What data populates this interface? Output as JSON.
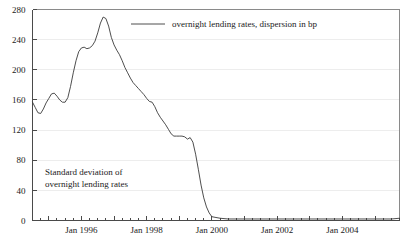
{
  "chart_data": {
    "type": "line",
    "title": "",
    "xlabel": "",
    "ylabel": "",
    "ylim": [
      0,
      280
    ],
    "xlim": [
      "1994-07",
      "2005-10"
    ],
    "grid": true,
    "legend_position": "top-center",
    "legend": [
      "overnight lending rates, dispersion in bp"
    ],
    "annotations": [
      {
        "text_line1": "Standard deviation of",
        "text_line2": "overnight lending rates",
        "x": "1995-04",
        "y": 62
      }
    ],
    "yticks": [
      0,
      40,
      80,
      120,
      160,
      200,
      240,
      280
    ],
    "ytick_labels": [
      "0",
      "40",
      "80",
      "120",
      "160",
      "200",
      "240",
      "280"
    ],
    "xtick_labels": [
      "Jan 1996",
      "Jan 1998",
      "Jan 2000",
      "Jan 2002",
      "Jan 2004"
    ],
    "xtick_positions": [
      "1996-01",
      "1998-01",
      "2000-01",
      "2002-01",
      "2004-01"
    ],
    "minor_tick_interval_months": 3,
    "series": [
      {
        "name": "overnight lending rates, dispersion in bp",
        "color": "#3a3a3a",
        "x": [
          "1994-07",
          "1994-08",
          "1994-09",
          "1994-10",
          "1994-11",
          "1994-12",
          "1995-01",
          "1995-02",
          "1995-03",
          "1995-04",
          "1995-05",
          "1995-06",
          "1995-07",
          "1995-08",
          "1995-09",
          "1995-10",
          "1995-11",
          "1995-12",
          "1996-01",
          "1996-02",
          "1996-03",
          "1996-04",
          "1996-05",
          "1996-06",
          "1996-07",
          "1996-08",
          "1996-09",
          "1996-10",
          "1996-11",
          "1996-12",
          "1997-01",
          "1997-02",
          "1997-03",
          "1997-04",
          "1997-05",
          "1997-06",
          "1997-07",
          "1997-08",
          "1997-09",
          "1997-10",
          "1997-11",
          "1997-12",
          "1998-01",
          "1998-02",
          "1998-03",
          "1998-04",
          "1998-05",
          "1998-06",
          "1998-07",
          "1998-08",
          "1998-09",
          "1998-10",
          "1998-11",
          "1998-12",
          "1999-01",
          "1999-02",
          "1999-03",
          "1999-04",
          "1999-05",
          "1999-06",
          "1999-07",
          "1999-08",
          "1999-09",
          "1999-10",
          "1999-11",
          "1999-12",
          "2000-01",
          "2000-04",
          "2000-07",
          "2000-10",
          "2001-01",
          "2001-04",
          "2001-07",
          "2001-10",
          "2002-01",
          "2002-04",
          "2002-07",
          "2002-10",
          "2003-01",
          "2003-04",
          "2003-07",
          "2003-10",
          "2004-01",
          "2004-04",
          "2004-07",
          "2004-10",
          "2005-01",
          "2005-04",
          "2005-07",
          "2005-10"
        ],
        "values": [
          157,
          150,
          143,
          142,
          148,
          156,
          162,
          168,
          169,
          165,
          160,
          157,
          157,
          163,
          178,
          196,
          212,
          224,
          229,
          230,
          228,
          229,
          232,
          238,
          249,
          262,
          270,
          268,
          258,
          243,
          233,
          226,
          220,
          212,
          203,
          196,
          189,
          183,
          179,
          175,
          171,
          167,
          162,
          158,
          157,
          151,
          143,
          137,
          132,
          127,
          121,
          115,
          112,
          112,
          112,
          112,
          111,
          108,
          110,
          104,
          88,
          68,
          47,
          30,
          18,
          10,
          5,
          3,
          2,
          2,
          2,
          2,
          2,
          2,
          2,
          2,
          2,
          2,
          2,
          2,
          2,
          2,
          2,
          2,
          2,
          2,
          2,
          2,
          2,
          3
        ]
      }
    ]
  },
  "legend": {
    "label": "overnight lending rates, dispersion in bp"
  },
  "annotation": {
    "line1": "Standard deviation of",
    "line2": "overnight lending rates"
  },
  "yaxis": {
    "labels": [
      "280",
      "240",
      "200",
      "160",
      "120",
      "80",
      "40",
      "0"
    ]
  },
  "xaxis": {
    "labels": [
      "Jan 1996",
      "Jan 1998",
      "Jan 2000",
      "Jan 2002",
      "Jan 2004"
    ]
  }
}
